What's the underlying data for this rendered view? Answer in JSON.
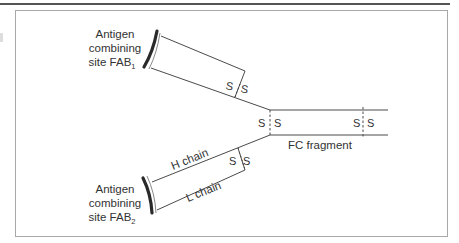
{
  "colors": {
    "background": "#ffffff",
    "top_rule": "#555555",
    "frame": "#a8a8a8",
    "line": "#4a4a4a",
    "text": "#333333",
    "arc": "#2a2a2a"
  },
  "labels": {
    "fab1": {
      "line1": "Antigen",
      "line2": "combining",
      "line3": "site FAB",
      "sub": "1"
    },
    "fab2": {
      "line1": "Antigen",
      "line2": "combining",
      "line3": "site FAB",
      "sub": "2"
    },
    "h_chain": "H chain",
    "l_chain": "L chain",
    "fc_fragment": "FC fragment",
    "s": "S"
  },
  "disulfide_bonds": [
    {
      "name": "fab1-interchain",
      "left": "S",
      "right": "S"
    },
    {
      "name": "hinge",
      "left": "S",
      "right": "S"
    },
    {
      "name": "fc-interchain",
      "left": "S",
      "right": "S"
    },
    {
      "name": "fab2-interchain",
      "left": "S",
      "right": "S"
    }
  ]
}
